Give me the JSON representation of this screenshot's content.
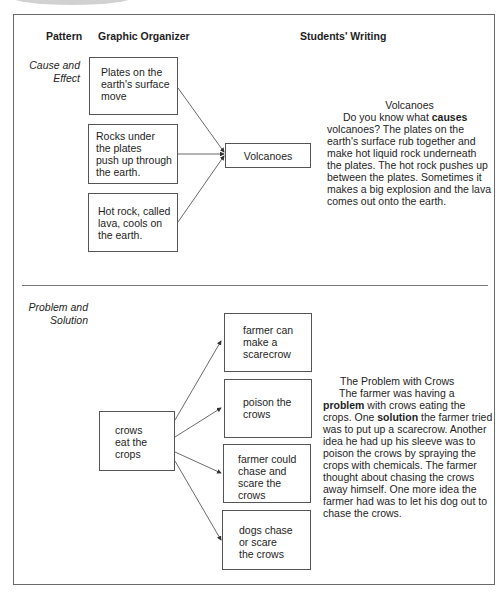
{
  "headers": {
    "pattern": "Pattern",
    "graphic_organizer": "Graphic Organizer",
    "students_writing": "Students' Writing"
  },
  "sections": [
    {
      "pattern": [
        "Cause and",
        "Effect"
      ],
      "causes": [
        [
          "Plates on the",
          "earth's surface",
          "move"
        ],
        [
          "Rocks under",
          "the plates",
          "push up through",
          "the earth."
        ],
        [
          "Hot rock, called",
          "lava, cools on",
          "the earth."
        ]
      ],
      "effect": "Volcanoes",
      "writing": {
        "title": "Volcanoes",
        "before_bold": "Do you know what ",
        "bold": "causes",
        "after_bold": " volcanoes? The plates on the earth's surface rub together and make hot liquid rock underneath the plates. The hot rock pushes up between the plates. Sometimes it makes a big explosion and the lava comes out onto the earth."
      }
    },
    {
      "pattern": [
        "Problem and",
        "Solution"
      ],
      "problem": [
        "crows",
        "eat the",
        "crops"
      ],
      "solutions": [
        [
          "farmer can",
          "make a",
          "scarecrow"
        ],
        [
          "poison the",
          "crows"
        ],
        [
          "farmer could",
          "chase and",
          "scare the",
          "crows"
        ],
        [
          "dogs chase",
          "or scare",
          "the crows"
        ]
      ],
      "writing": {
        "title": "The Problem with Crows",
        "part1": "The farmer was having a ",
        "bold1": "problem",
        "part2": " with crows eating the crops. One ",
        "bold2": "solution",
        "part3": " the farmer tried was to put up a scarecrow. Another idea he had up his sleeve was to poison the crows by spraying the crops with chemicals. The farmer thought about chasing the crows away himself. One more idea the farmer had was to let his dog out to chase the crows."
      }
    }
  ]
}
